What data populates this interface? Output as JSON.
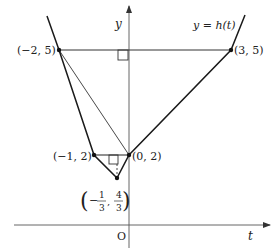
{
  "figure": {
    "curve_label": "y = h(t)",
    "axes": {
      "x_label": "t",
      "y_label": "y",
      "origin_label": "O"
    },
    "points": [
      {
        "name": "A",
        "label": "(−2, 5)",
        "x": -2,
        "y": 5
      },
      {
        "name": "B",
        "label": "(3, 5)",
        "x": 3,
        "y": 5
      },
      {
        "name": "C",
        "label": "(0, 2)",
        "x": 0,
        "y": 2
      },
      {
        "name": "D",
        "label": "(−1, 2)",
        "x": -1,
        "y": 2
      },
      {
        "name": "E",
        "label_num1": "1",
        "label_den1": "3",
        "label_num2": "4",
        "label_den2": "3",
        "label_sign": "−",
        "x": -0.3333,
        "y": 1.3333
      }
    ],
    "segments": [
      {
        "type": "curve",
        "description": "y = h(t) polyline through (−2,5),(−1,2),(−1/3,4/3),(0,2),(3,5)"
      },
      {
        "type": "thin",
        "from": "(−2,5)",
        "to": "(3,5)"
      },
      {
        "type": "thin",
        "from": "(−2,5)",
        "to": "(0,2)"
      },
      {
        "type": "thin",
        "from": "(−1,2)",
        "to": "(0,2)"
      },
      {
        "type": "dashed",
        "from": "(−1/3,4/3)",
        "to": "foot on segment (−1,2)-(0,2)"
      }
    ],
    "right_angle_marks": 2,
    "colors": {
      "stroke": "#222222",
      "axis": "#444444"
    }
  }
}
